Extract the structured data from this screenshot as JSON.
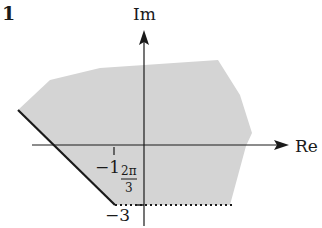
{
  "figure": {
    "number": "1",
    "axes": {
      "imaginary_label": "Im",
      "real_label": "Re"
    },
    "annotations": {
      "minus_one": "−1",
      "angle_numerator": "2π",
      "angle_denominator": "3",
      "minus_three": "−3"
    },
    "region": {
      "description": "shaded region in the complex plane",
      "fill_color": "#d4d4d4",
      "boundary_solid_color": "#1a1a1a",
      "boundary_dotted_color": "#1a1a1a"
    },
    "colors": {
      "axis": "#1a1a1a",
      "text": "#1a1a1a",
      "background": "#ffffff"
    }
  }
}
